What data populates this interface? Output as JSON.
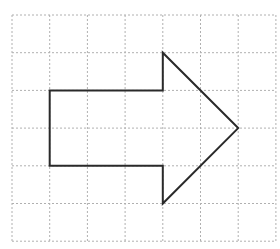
{
  "figure": {
    "grid": {
      "columns": 7,
      "rows": 6,
      "origin_x": 12,
      "origin_y": 15,
      "cell_size": 37.7,
      "line_color": "#b0b0b0",
      "line_style": "dotted"
    },
    "shape": {
      "name": "arrow-right",
      "stroke_color": "#2a2a2a",
      "stroke_width": 2,
      "fill": "none",
      "vertices_grid": [
        [
          1,
          2
        ],
        [
          4,
          2
        ],
        [
          4,
          1
        ],
        [
          6,
          3
        ],
        [
          4,
          5
        ],
        [
          4,
          4
        ],
        [
          1,
          4
        ]
      ]
    }
  }
}
